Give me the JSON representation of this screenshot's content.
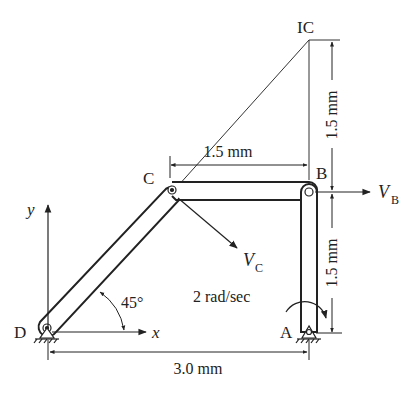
{
  "diagram": {
    "type": "four-bar linkage velocity analysis",
    "points": {
      "D": "D",
      "A": "A",
      "B": "B",
      "C": "C",
      "IC": "IC"
    },
    "axes": {
      "x_label": "x",
      "y_label": "y"
    },
    "angle_label": "45°",
    "angular_velocity_label": "2 rad/sec",
    "velocity_labels": {
      "vb_main": "V",
      "vb_sub": "B",
      "vc_main": "V",
      "vc_sub": "C"
    },
    "dimensions": {
      "cb_length": "1.5 mm",
      "ic_to_b": "1.5 mm",
      "b_to_a": "1.5 mm",
      "d_to_a": "3.0 mm"
    },
    "colors": {
      "ink": "#222222",
      "background": "#ffffff"
    }
  }
}
